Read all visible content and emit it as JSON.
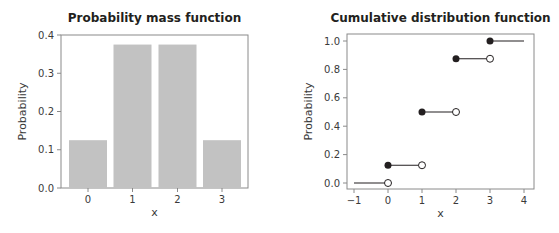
{
  "chart_data": [
    {
      "type": "bar",
      "title": "Probability mass function",
      "xlabel": "x",
      "ylabel": "Probability",
      "categories": [
        "0",
        "1",
        "2",
        "3"
      ],
      "values": [
        0.125,
        0.375,
        0.375,
        0.125
      ],
      "ylim": [
        0,
        0.4
      ],
      "yticks": [
        "0.0",
        "0.1",
        "0.2",
        "0.3",
        "0.4"
      ],
      "grid": false,
      "bar_color": "#c2c2c2"
    },
    {
      "type": "line",
      "subtype": "step",
      "title": "Cumulative distribution function",
      "xlabel": "x",
      "ylabel": "Probability",
      "xlim": [
        -1,
        4
      ],
      "ylim": [
        0,
        1
      ],
      "xticks": [
        "-1",
        "0",
        "1",
        "2",
        "3",
        "4"
      ],
      "yticks": [
        "0.0",
        "0.2",
        "0.4",
        "0.6",
        "0.8",
        "1.0"
      ],
      "segments": [
        {
          "x_start": -1,
          "x_end": 0,
          "y": 0.0,
          "closed_start": false,
          "open_end": true
        },
        {
          "x_start": 0,
          "x_end": 1,
          "y": 0.125,
          "closed_start": true,
          "open_end": true
        },
        {
          "x_start": 1,
          "x_end": 2,
          "y": 0.5,
          "closed_start": true,
          "open_end": true
        },
        {
          "x_start": 2,
          "x_end": 3,
          "y": 0.875,
          "closed_start": true,
          "open_end": true
        },
        {
          "x_start": 3,
          "x_end": 4,
          "y": 1.0,
          "closed_start": true,
          "open_end": false
        }
      ],
      "grid": false
    }
  ]
}
